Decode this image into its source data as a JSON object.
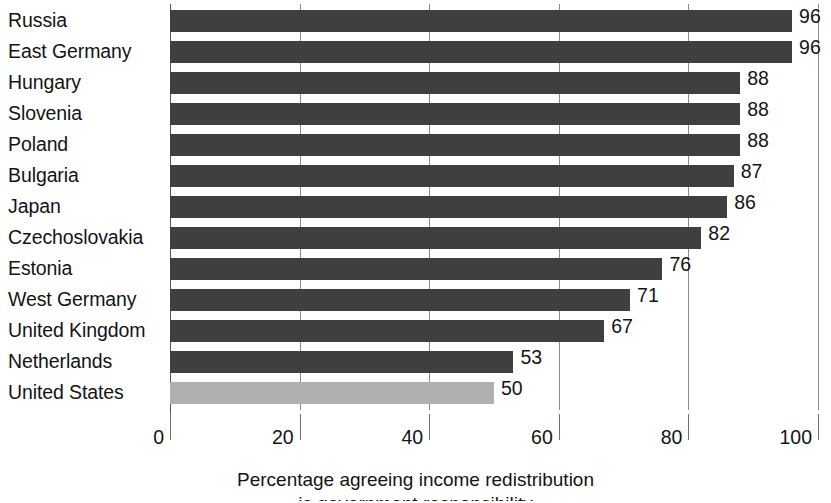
{
  "chart_data": {
    "type": "bar",
    "orientation": "horizontal",
    "title": "",
    "xlabel": "Percentage agreeing income redistribution",
    "xlabel_line2": "is government responsibility",
    "ylabel": "",
    "xlim": [
      0,
      100
    ],
    "xticks": [
      0,
      20,
      40,
      60,
      80,
      100
    ],
    "grid": true,
    "grid_axis": "x",
    "legend": "none",
    "categories": [
      "Russia",
      "East Germany",
      "Hungary",
      "Slovenia",
      "Poland",
      "Bulgaria",
      "Japan",
      "Czechoslovakia",
      "Estonia",
      "West Germany",
      "United Kingdom",
      "Netherlands",
      "United States"
    ],
    "values": [
      96,
      96,
      88,
      88,
      88,
      87,
      86,
      82,
      76,
      71,
      67,
      53,
      50
    ],
    "value_labels": [
      "96",
      "96",
      "88",
      "88",
      "88",
      "87",
      "86",
      "82",
      "76",
      "71",
      "67",
      "53",
      "50"
    ],
    "highlighted_category": "United States",
    "colors": {
      "bar": "#3f3f3f",
      "bar_highlight": "#b0b0b0",
      "gridline": "#8a8a8a",
      "axis": "#555555",
      "text": "#141414",
      "background": "#ffffff"
    }
  },
  "axis": {
    "tick_labels": [
      "0",
      "20",
      "40",
      "60",
      "80",
      "100"
    ]
  }
}
